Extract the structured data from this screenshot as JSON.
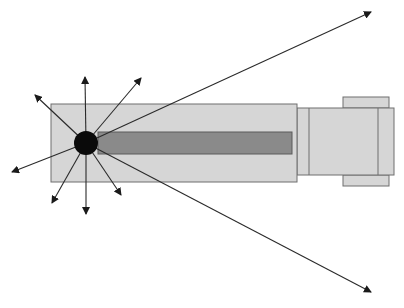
{
  "diagram": {
    "colors": {
      "background": "#ffffff",
      "body_fill": "#d6d6d6",
      "body_stroke": "#6e6e6e",
      "inner_bar_fill": "#8a8a8a",
      "source_fill": "#0a0a0a",
      "ray_stroke": "#2a2a2a"
    },
    "body": {
      "x": 51,
      "y": 104,
      "w": 246,
      "h": 78
    },
    "inner_bar": {
      "x": 98,
      "y": 132,
      "w": 194,
      "h": 22
    },
    "cap": {
      "x": 297,
      "y": 108,
      "w": 97,
      "h": 67,
      "divider_left_x": 309,
      "divider_right_x": 378
    },
    "top_tab": {
      "x": 343,
      "y": 97,
      "w": 46,
      "h": 11
    },
    "bottom_tab": {
      "x": 343,
      "y": 175,
      "w": 46,
      "h": 11
    },
    "source": {
      "cx": 86,
      "cy": 143,
      "r": 12
    },
    "rays": [
      {
        "name": "ray-up",
        "x2": 85,
        "y2": 77
      },
      {
        "name": "ray-up-left",
        "x2": 35,
        "y2": 95
      },
      {
        "name": "ray-up-right",
        "x2": 141,
        "y2": 78
      },
      {
        "name": "ray-left-down",
        "x2": 12,
        "y2": 172
      },
      {
        "name": "ray-down-left",
        "x2": 52,
        "y2": 203
      },
      {
        "name": "ray-down",
        "x2": 86,
        "y2": 214
      },
      {
        "name": "ray-down-right",
        "x2": 121,
        "y2": 195
      },
      {
        "name": "ray-long-upper-right",
        "x2": 371,
        "y2": 12
      },
      {
        "name": "ray-long-lower-right",
        "x2": 371,
        "y2": 292
      }
    ]
  }
}
